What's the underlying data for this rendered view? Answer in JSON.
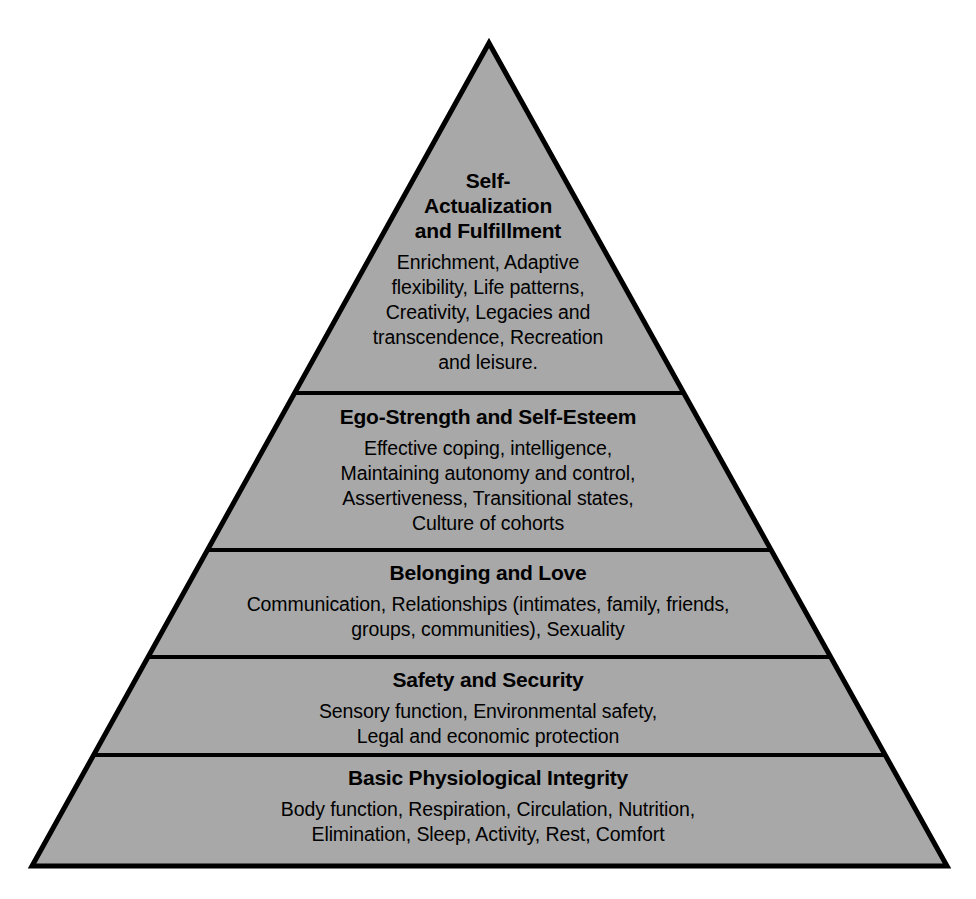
{
  "figure": {
    "name": "hierarchy-of-needs-pyramid",
    "background_color": "#ffffff",
    "fill_color": "#a8a8a8",
    "outline_color": "#000000",
    "text_color": "#000000",
    "outline_width_px": 5,
    "divider_width_px": 4,
    "apex": {
      "x": 489,
      "y": 43
    },
    "base_left": {
      "x": 32,
      "y": 866
    },
    "base_right": {
      "x": 947,
      "y": 866
    },
    "divider_y": [
      393,
      550,
      657,
      755
    ]
  },
  "chart_data": {
    "type": "pyramid",
    "title": "",
    "orientation": "apex-up",
    "level_count": 5,
    "levels": [
      {
        "rank": 5,
        "position": "top",
        "title": "Self-\nActualization\nand Fulfillment",
        "body": "Enrichment, Adaptive\nflexibility, Life patterns,\nCreativity, Legacies and\ntranscendence, Recreation\nand leisure."
      },
      {
        "rank": 4,
        "position": "second",
        "title": "Ego-Strength and Self-Esteem",
        "body": "Effective coping, intelligence,\nMaintaining autonomy and control,\nAssertiveness, Transitional states,\nCulture of cohorts"
      },
      {
        "rank": 3,
        "position": "middle",
        "title": "Belonging and Love",
        "body": "Communication, Relationships (intimates, family, friends,\ngroups, communities), Sexuality"
      },
      {
        "rank": 2,
        "position": "fourth",
        "title": "Safety and Security",
        "body": "Sensory function, Environmental safety,\nLegal and economic protection"
      },
      {
        "rank": 1,
        "position": "base",
        "title": "Basic Physiological Integrity",
        "body": "Body function, Respiration, Circulation, Nutrition,\nElimination, Sleep, Activity, Rest, Comfort"
      }
    ]
  }
}
